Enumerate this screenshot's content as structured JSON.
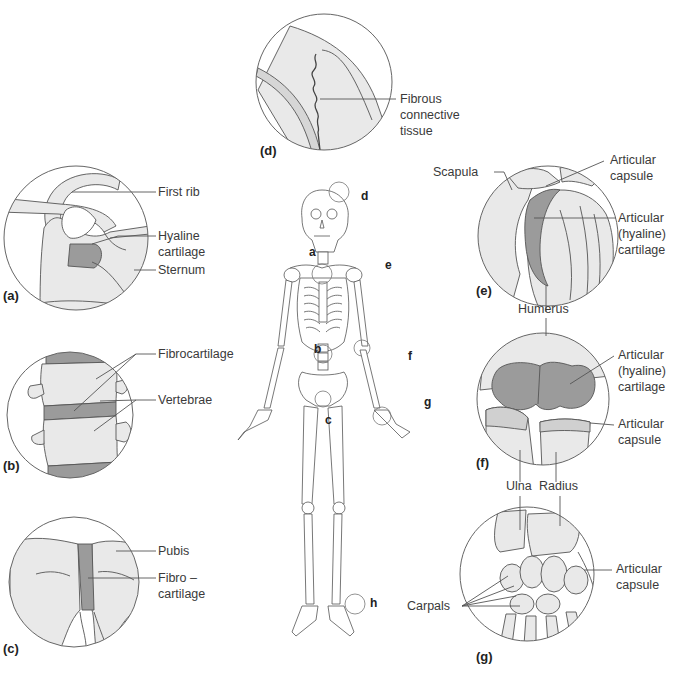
{
  "figure": {
    "type": "anatomical diagram",
    "colors": {
      "bone_fill": "#e9e9e9",
      "cartilage_fill": "#9b9b9b",
      "line": "#555555",
      "text": "#3a3a3a",
      "background": "#ffffff"
    },
    "skeleton_markers": [
      "a",
      "b",
      "c",
      "d",
      "e",
      "f",
      "g",
      "h"
    ],
    "panels": [
      {
        "id": "a",
        "letter": "(a)",
        "labels": [
          "First rib",
          "Hyaline cartilage",
          "Sternum"
        ]
      },
      {
        "id": "b",
        "letter": "(b)",
        "labels": [
          "Fibrocartilage",
          "Vertebrae"
        ]
      },
      {
        "id": "c",
        "letter": "(c)",
        "labels": [
          "Pubis",
          "Fibro – cartilage"
        ]
      },
      {
        "id": "d",
        "letter": "(d)",
        "labels": [
          "Fibrous connective tissue"
        ]
      },
      {
        "id": "e",
        "letter": "(e)",
        "labels": [
          "Scapula",
          "Articular capsule",
          "Articular (hyaline) cartilage",
          "Humerus"
        ]
      },
      {
        "id": "f",
        "letter": "(f)",
        "labels": [
          "Articular (hyaline) cartilage",
          "Articular capsule",
          "Ulna",
          "Radius"
        ]
      },
      {
        "id": "g",
        "letter": "(g)",
        "labels": [
          "Carpals",
          "Articular capsule"
        ]
      }
    ]
  },
  "labels": {
    "a_first_rib": "First rib",
    "a_hyaline_1": "Hyaline",
    "a_hyaline_2": "cartilage",
    "a_sternum": "Sternum",
    "b_fibrocartilage": "Fibrocartilage",
    "b_vertebrae": "Vertebrae",
    "c_pubis": "Pubis",
    "c_fibro_1": "Fibro –",
    "c_fibro_2": "cartilage",
    "d_fibrous_1": "Fibrous",
    "d_fibrous_2": "connective",
    "d_fibrous_3": "tissue",
    "e_scapula": "Scapula",
    "e_capsule_1": "Articular",
    "e_capsule_2": "capsule",
    "e_cart_1": "Articular",
    "e_cart_2": "(hyaline)",
    "e_cart_3": "cartilage",
    "humerus": "Humerus",
    "f_cart_1": "Articular",
    "f_cart_2": "(hyaline)",
    "f_cart_3": "cartilage",
    "f_capsule_1": "Articular",
    "f_capsule_2": "capsule",
    "ulna": "Ulna",
    "radius": "Radius",
    "g_carpals": "Carpals",
    "g_capsule_1": "Articular",
    "g_capsule_2": "capsule"
  },
  "panel_letters": {
    "a": "(a)",
    "b": "(b)",
    "c": "(c)",
    "d": "(d)",
    "e": "(e)",
    "f": "(f)",
    "g": "(g)"
  },
  "skeleton_letters": {
    "a": "a",
    "b": "b",
    "c": "c",
    "d": "d",
    "e": "e",
    "f": "f",
    "g": "g",
    "h": "h"
  }
}
